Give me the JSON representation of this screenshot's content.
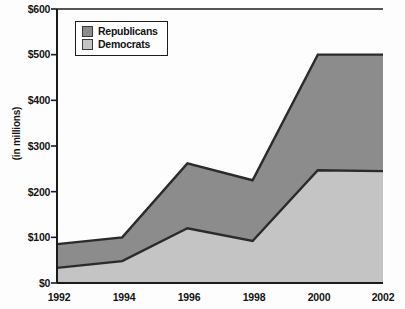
{
  "chart_data": {
    "type": "area",
    "stacked": true,
    "title": "",
    "subtitle": "",
    "xlabel": "",
    "ylabel": "(in millions)",
    "categories": [
      "1992",
      "1994",
      "1996",
      "1998",
      "2000",
      "2002"
    ],
    "x": [
      1992,
      1994,
      1996,
      1998,
      2000,
      2002
    ],
    "series": [
      {
        "name": "Democrats",
        "color": "#c4c4c4",
        "values": [
          33,
          48,
          120,
          92,
          247,
          245
        ]
      },
      {
        "name": "Republicans",
        "color": "#8c8c8c",
        "values": [
          52,
          52,
          142,
          133,
          253,
          255
        ]
      }
    ],
    "stacked_totals": [
      85,
      100,
      262,
      225,
      500,
      500
    ],
    "ylim": [
      0,
      600
    ],
    "ytick_values": [
      0,
      100,
      200,
      300,
      400,
      500,
      600
    ],
    "ytick_labels": [
      "$0",
      "$100",
      "$200",
      "$300",
      "$400",
      "$500",
      "$600"
    ],
    "xlim": [
      1992,
      2002
    ],
    "grid": false,
    "legend_position": "top-left"
  },
  "legend": {
    "items": [
      {
        "label": "Republicans",
        "color": "#8c8c8c"
      },
      {
        "label": "Democrats",
        "color": "#c4c4c4"
      }
    ]
  },
  "axes": {
    "y_title": "(in millions)",
    "y_labels": [
      "$600",
      "$500",
      "$400",
      "$300",
      "$200",
      "$100",
      "$0"
    ],
    "x_labels": [
      "1992",
      "1994",
      "1996",
      "1998",
      "2000",
      "2002"
    ]
  },
  "colors": {
    "republicans_fill": "#8c8c8c",
    "democrats_fill": "#c4c4c4",
    "outline": "#2b2b2b",
    "axis": "#1b1b1b",
    "background": "#fdfdfd"
  }
}
